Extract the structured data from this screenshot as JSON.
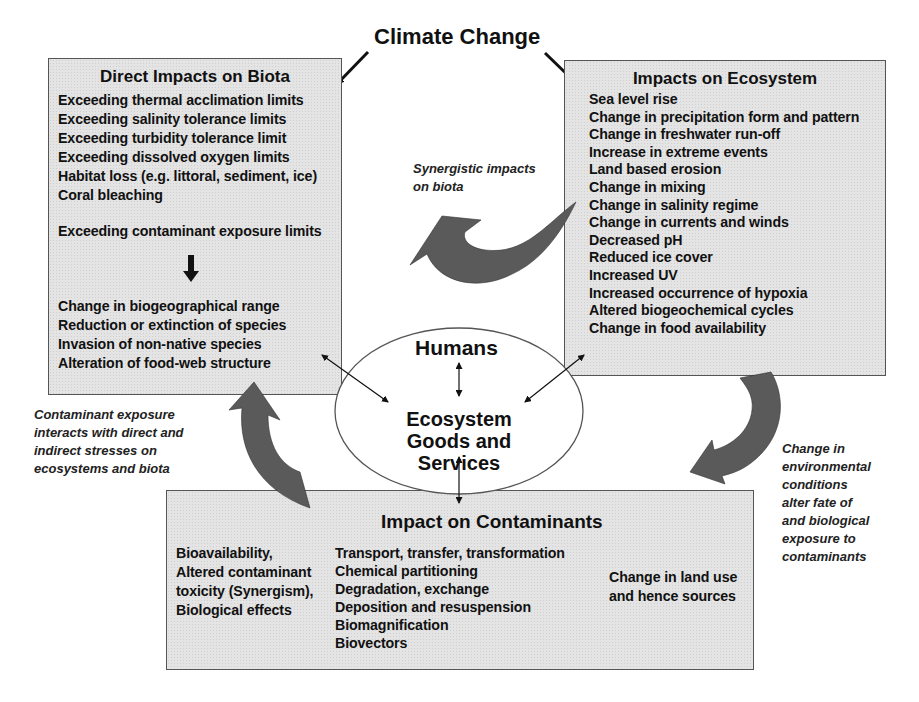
{
  "title": "Climate Change",
  "direct_impacts": {
    "title": "Direct Impacts on Biota",
    "items_top": [
      "Exceeding thermal acclimation limits",
      "Exceeding salinity tolerance limits",
      "Exceeding turbidity tolerance limit",
      "Exceeding dissolved oxygen limits",
      "Habitat loss (e.g. littoral, sediment, ice)",
      "Coral bleaching"
    ],
    "contaminant_item": "Exceeding contaminant exposure limits",
    "items_bottom": [
      "Change in biogeographical range",
      "Reduction or extinction of species",
      "Invasion of non-native species",
      "Alteration of food-web structure"
    ]
  },
  "ecosystem_impacts": {
    "title": "Impacts on Ecosystem",
    "items": [
      "Sea level rise",
      "Change in precipitation form and pattern",
      "Change in freshwater run-off",
      "Increase in extreme events",
      "Land based erosion",
      "Change in mixing",
      "Change in salinity regime",
      "Change in currents and winds",
      "Decreased pH",
      "Reduced ice cover",
      "Increased UV",
      "Increased occurrence of hypoxia",
      "Altered biogeochemical cycles",
      "Change in food availability"
    ]
  },
  "center": {
    "humans": "Humans",
    "ecosystem_line1": "Ecosystem",
    "ecosystem_line2": "Goods and Services"
  },
  "contaminants": {
    "title": "Impact on Contaminants",
    "left_items": [
      "Bioavailability,",
      "Altered contaminant",
      "toxicity (Synergism),",
      "Biological effects"
    ],
    "center_items": [
      "Transport, transfer, transformation",
      "Chemical partitioning",
      "Degradation, exchange",
      "Deposition and resuspension",
      "Biomagnification",
      "Biovectors"
    ],
    "right_items": [
      "Change in land use",
      "and hence sources"
    ]
  },
  "notes": {
    "synergistic": [
      "Synergistic impacts",
      "on biota"
    ],
    "contaminant_exposure": [
      "Contaminant exposure",
      "interacts with direct and",
      "indirect stresses on",
      "ecosystems and biota"
    ],
    "environmental_change": [
      "Change in",
      "environmental",
      "conditions",
      "alter fate of",
      "and biological",
      "exposure to",
      "contaminants"
    ]
  },
  "colors": {
    "box_fill": "#e4e4e4",
    "box_border": "#555555",
    "curved_arrow": "#5a5a5a",
    "text": "#111111"
  }
}
